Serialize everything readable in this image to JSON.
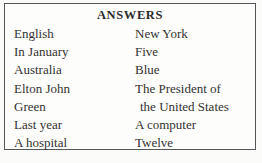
{
  "panel": {
    "title": "ANSWERS",
    "left": [
      "English",
      "In January",
      "Australia",
      "Elton John",
      "Green",
      "Last year",
      "A hospital"
    ],
    "right_lines": [
      "New York",
      "Five",
      "Blue",
      "The President of",
      "the United States",
      "A computer",
      "Twelve"
    ]
  }
}
